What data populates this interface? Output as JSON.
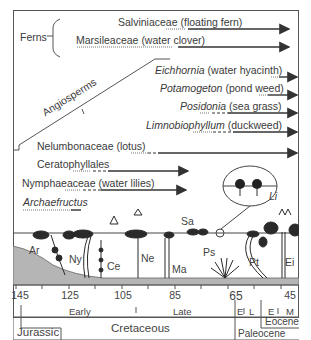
{
  "groups": {
    "ferns": "Ferns",
    "angiosperms": "Angiosperms"
  },
  "taxa": [
    {
      "id": "salviniaceae",
      "name": "Salviniaceae",
      "common": "(floating fern)",
      "italic": false
    },
    {
      "id": "marsileaceae",
      "name": "Marsileaceae",
      "common": "(water clover)",
      "italic": false
    },
    {
      "id": "eichhornia",
      "name": "Eichhornia",
      "common": "(water hyacinth)",
      "italic": true
    },
    {
      "id": "potamogeton",
      "name": "Potamogeton",
      "common": "(pond weed)",
      "italic": true
    },
    {
      "id": "posidonia",
      "name": "Posidonia",
      "common": "(sea grass)",
      "italic": true
    },
    {
      "id": "limnobiophyllum",
      "name": "Limnobiophyllum",
      "common": "(duckweed)",
      "italic": true
    },
    {
      "id": "nelumbonaceae",
      "name": "Nelumbonaceae",
      "common": "(lotus)",
      "italic": false
    },
    {
      "id": "ceratophyllales",
      "name": "Ceratophyllales",
      "common": "",
      "italic": false
    },
    {
      "id": "nymphaeaceae",
      "name": "Nymphaeaceae",
      "common": "(water lilies)",
      "italic": false
    },
    {
      "id": "archaefructus",
      "name": "Archaefructus",
      "common": "",
      "italic": true
    }
  ],
  "plants": [
    {
      "abbr": "Ar"
    },
    {
      "abbr": "Ny"
    },
    {
      "abbr": "Ce"
    },
    {
      "abbr": "Ne"
    },
    {
      "abbr": "Ma"
    },
    {
      "abbr": "Sa"
    },
    {
      "abbr": "Ps"
    },
    {
      "abbr": "Pt"
    },
    {
      "abbr": "Ei"
    },
    {
      "abbr": "Li"
    }
  ],
  "timescale": {
    "ticks": [
      "145",
      "125",
      "105",
      "85",
      "65",
      "45"
    ],
    "subdivisions": [
      "Early",
      "Late",
      "E",
      "L",
      "E",
      "M"
    ],
    "periods": [
      "Jurassic",
      "Cretaceous",
      "Paleocene",
      "Eocene"
    ]
  }
}
